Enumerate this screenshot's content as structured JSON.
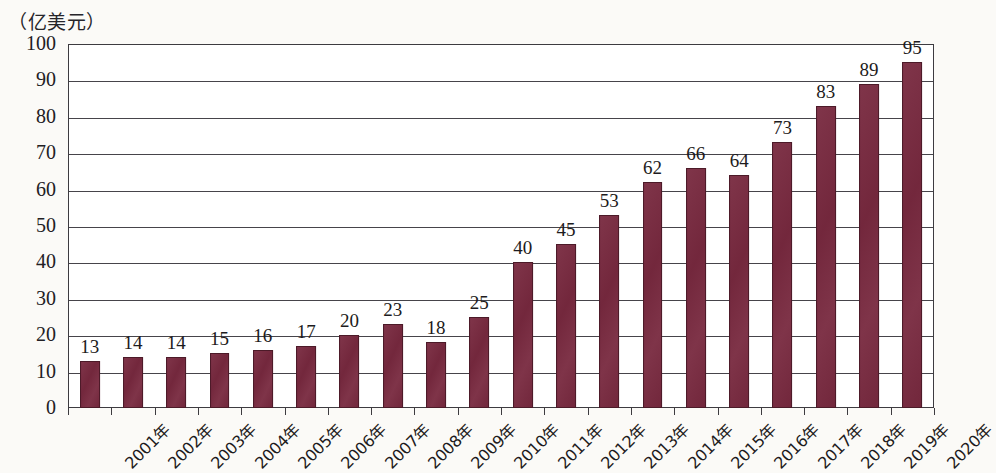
{
  "caption": "（亿美元）",
  "colors": {
    "bar_fill": "#78293f",
    "bar_stroke": "#4c1a28",
    "axis": "#3d3b40",
    "text": "#1d1b20",
    "background": "#fbfaf7",
    "plot_background": "#ffffff"
  },
  "chart_data": {
    "type": "bar",
    "title": "",
    "subtitle": "",
    "xlabel": "",
    "ylabel": "（亿美元）",
    "ylim": [
      0,
      100
    ],
    "ytick_step": 10,
    "yticks": [
      0,
      10,
      20,
      30,
      40,
      50,
      60,
      70,
      80,
      90,
      100
    ],
    "ytick_labels": [
      "0",
      "10",
      "20",
      "30",
      "40",
      "50",
      "60",
      "70",
      "80",
      "90",
      "100"
    ],
    "grid": "horizontal",
    "legend": null,
    "legend_position": "none",
    "categories": [
      "2001年",
      "2002年",
      "2003年",
      "2004年",
      "2005年",
      "2006年",
      "2007年",
      "2008年",
      "2009年",
      "2010年",
      "2011年",
      "2012年",
      "2013年",
      "2014年",
      "2015年",
      "2016年",
      "2017年",
      "2018年",
      "2019年",
      "2020年"
    ],
    "values": [
      13,
      14,
      14,
      15,
      16,
      17,
      20,
      23,
      18,
      25,
      40,
      45,
      53,
      62,
      66,
      64,
      73,
      83,
      89,
      95
    ],
    "value_labels": [
      "13",
      "14",
      "14",
      "15",
      "16",
      "17",
      "20",
      "23",
      "18",
      "25",
      "40",
      "45",
      "53",
      "62",
      "66",
      "64",
      "73",
      "83",
      "89",
      "95"
    ],
    "data_labels_shown": true,
    "xtick_rotation": -45
  }
}
